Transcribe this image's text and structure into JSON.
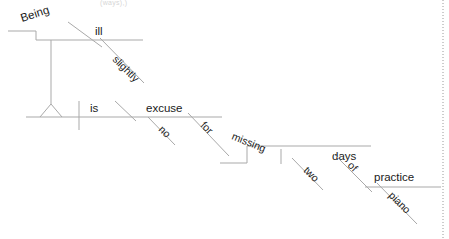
{
  "diagram": {
    "type": "reed-kellogg-sentence-diagram",
    "sentence": "Being slightly ill is no excuse for missing two days of piano practice.",
    "faint_top_text": "(ways),)",
    "line_color": "#a9a9a9",
    "text_color": "#1a1a1a",
    "background": "#ffffff",
    "right_edge_rule": "dotted",
    "words": {
      "being": "Being",
      "ill": "ill",
      "slightly": "slightly",
      "is": "is",
      "excuse": "excuse",
      "no": "no",
      "for": "for",
      "missing": "missing",
      "two": "two",
      "days": "days",
      "of": "of",
      "practice": "practice",
      "piano": "piano"
    },
    "parts": [
      {
        "word": "Being",
        "role": "gerund-subject",
        "baseline": "upper-pedestal"
      },
      {
        "word": "slightly",
        "role": "adverb-modifier",
        "baseline": "slant-under-ill"
      },
      {
        "word": "ill",
        "role": "predicate-adjective",
        "baseline": "upper"
      },
      {
        "word": "is",
        "role": "linking-verb",
        "baseline": "main"
      },
      {
        "word": "no",
        "role": "adjective-modifier",
        "baseline": "slant-under-excuse"
      },
      {
        "word": "excuse",
        "role": "predicate-nominative",
        "baseline": "main"
      },
      {
        "word": "for",
        "role": "preposition",
        "baseline": "slant"
      },
      {
        "word": "missing",
        "role": "gerund-object-of-prep",
        "baseline": "step"
      },
      {
        "word": "two",
        "role": "adjective-modifier",
        "baseline": "slant-under-days"
      },
      {
        "word": "days",
        "role": "direct-object",
        "baseline": "step"
      },
      {
        "word": "of",
        "role": "preposition",
        "baseline": "slant"
      },
      {
        "word": "piano",
        "role": "noun-adjunct",
        "baseline": "slant-under-practice"
      },
      {
        "word": "practice",
        "role": "object-of-preposition",
        "baseline": "step-lower"
      }
    ]
  }
}
